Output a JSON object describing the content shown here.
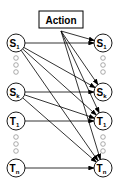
{
  "diagram": {
    "action_label": "Action",
    "nodes": [
      {
        "id": "S1L",
        "main": "S",
        "sub": "1",
        "x": 16,
        "y": 43
      },
      {
        "id": "SkL",
        "main": "S",
        "sub": "k",
        "x": 16,
        "y": 92
      },
      {
        "id": "T1L",
        "main": "T",
        "sub": "1",
        "x": 16,
        "y": 121
      },
      {
        "id": "TnL",
        "main": "T",
        "sub": "n",
        "x": 16,
        "y": 168
      },
      {
        "id": "S1R",
        "main": "S",
        "sub": "1",
        "x": 103,
        "y": 43
      },
      {
        "id": "SkR",
        "main": "S",
        "sub": "k",
        "x": 103,
        "y": 92
      },
      {
        "id": "T1R",
        "main": "T",
        "sub": "1",
        "x": 103,
        "y": 121
      },
      {
        "id": "TnR",
        "main": "T",
        "sub": "n",
        "x": 103,
        "y": 168
      }
    ],
    "edges": [
      [
        "S1L",
        "S1R"
      ],
      [
        "S1L",
        "SkR"
      ],
      [
        "S1L",
        "T1R"
      ],
      [
        "S1L",
        "TnR"
      ],
      [
        "SkL",
        "SkR"
      ],
      [
        "SkL",
        "T1R"
      ],
      [
        "SkL",
        "TnR"
      ],
      [
        "T1L",
        "T1R"
      ],
      [
        "TnL",
        "TnR"
      ],
      [
        "Action",
        "S1R"
      ],
      [
        "Action",
        "SkR"
      ],
      [
        "Action",
        "T1R"
      ],
      [
        "Action",
        "TnR"
      ]
    ],
    "ellipsis_dots": [
      {
        "x": 16,
        "ys": [
          58,
          65,
          72
        ]
      },
      {
        "x": 103,
        "ys": [
          58,
          65,
          72
        ]
      },
      {
        "x": 16,
        "ys": [
          137,
          144,
          151
        ]
      },
      {
        "x": 103,
        "ys": [
          137,
          144,
          151
        ]
      }
    ]
  }
}
